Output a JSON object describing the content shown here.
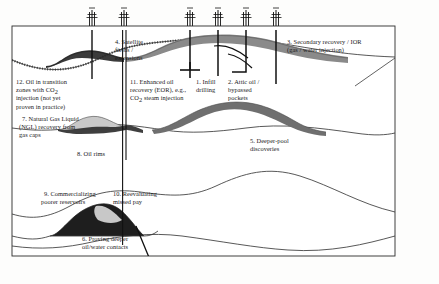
{
  "diagram": {
    "type": "geological-cross-section",
    "colors": {
      "background": "#fdfdfc",
      "frame_line": "#2b2b2b",
      "strata_line": "#3a3a3a",
      "reservoir_gray": "#8a8a8a",
      "reservoir_gray_dark": "#6f6f6f",
      "oil_dark": "#1e1e1e",
      "gas_cap_light": "#c8c8c8",
      "well_line": "#111111",
      "text": "#1a1a1a"
    },
    "frame": {
      "outer": true,
      "inner_surface_box": true
    }
  },
  "labels": [
    {
      "id": "1",
      "name": "infill-drilling",
      "lines": [
        "1. Infill",
        "drilling"
      ],
      "x": 196,
      "y": 84
    },
    {
      "id": "2",
      "name": "attic-oil-bypassed-pockets",
      "lines": [
        "2. Attic oil /",
        "bypassed",
        "pockets"
      ],
      "x": 228,
      "y": 84
    },
    {
      "id": "3",
      "name": "secondary-recovery-ior",
      "lines": [
        "3. Secondary recovery / IOR",
        "(gas / water injection)"
      ],
      "x": 287,
      "y": 44
    },
    {
      "id": "4",
      "name": "satellite-fields-extensions",
      "lines": [
        "4. Satellite",
        "fields /",
        "extensions"
      ],
      "x": 115,
      "y": 44
    },
    {
      "id": "5",
      "name": "deeper-pool-discoveries",
      "lines": [
        "5. Deeper-pool",
        "discoveries",
        ""
      ],
      "x": 250,
      "y": 143
    },
    {
      "id": "6",
      "name": "proving-deeper-oil-water-contacts",
      "lines": [
        "6. Proving deeper",
        "oil/water contacts"
      ],
      "x": 82,
      "y": 241
    },
    {
      "id": "7",
      "name": "ngl-recovery-from-gas-caps",
      "lines": [
        "7. Natural Gas Liquid",
        "(NGL) recovery from",
        "gas caps"
      ],
      "x": 22,
      "y": 121
    },
    {
      "id": "8",
      "name": "oil-rims",
      "lines": [
        "8. Oil rims"
      ],
      "x": 77,
      "y": 156
    },
    {
      "id": "9",
      "name": "commercializing-poorer-reservoirs",
      "lines": [
        "9. Commercializing",
        "poorer reservoirs"
      ],
      "x": 44,
      "y": 196
    },
    {
      "id": "10",
      "name": "reevaluating-missed-pay",
      "lines": [
        "10. Reevaluating",
        "missed pay"
      ],
      "x": 113,
      "y": 196
    },
    {
      "id": "11",
      "name": "enhanced-oil-recovery-eor",
      "lines": [
        "11. Enhanced oil",
        "recovery (EOR), e.g.,",
        "CO2 steam injection"
      ],
      "x": 130,
      "y": 84
    },
    {
      "id": "12",
      "name": "oil-in-transition-zones-co2",
      "lines": [
        "12. Oil in transition",
        "zones with CO2",
        "injection (not yet",
        "proven in practice)"
      ],
      "x": 16,
      "y": 84
    }
  ],
  "derricks": [
    {
      "name": "derrick-1",
      "x": 92
    },
    {
      "name": "derrick-2",
      "x": 124
    },
    {
      "name": "derrick-3",
      "x": 190
    },
    {
      "name": "derrick-4",
      "x": 218
    },
    {
      "name": "derrick-5",
      "x": 246
    },
    {
      "name": "derrick-6",
      "x": 276
    }
  ],
  "wellbores": [
    {
      "name": "wellbore-satellite-left",
      "x": 92,
      "bottom": 79
    },
    {
      "name": "wellbore-deep-vertical",
      "x": 124,
      "bottom": 245
    },
    {
      "name": "wellbore-eor-injector",
      "x": 190,
      "bottom": 70
    },
    {
      "name": "wellbore-infill",
      "x": 218,
      "bottom": 76
    },
    {
      "name": "wellbore-attic-deviated",
      "x": 246,
      "bottom": 72
    },
    {
      "name": "wellbore-secondary-deep",
      "x": 276,
      "bottom": 84
    }
  ],
  "markers": [
    {
      "name": "injection-cross-marker",
      "x": 190,
      "y": 70
    }
  ],
  "reservoirs": [
    {
      "name": "reservoir-satellite-left",
      "fill": "oil_dark"
    },
    {
      "name": "reservoir-main-dome",
      "fill": "reservoir_gray"
    },
    {
      "name": "reservoir-gas-cap-mid",
      "fill": "gas_cap_light"
    },
    {
      "name": "reservoir-oil-rim-mid",
      "fill": "oil_dark"
    },
    {
      "name": "reservoir-deeper-pool",
      "fill": "reservoir_gray_dark"
    },
    {
      "name": "reservoir-lower-oil",
      "fill": "oil_dark"
    },
    {
      "name": "reservoir-lower-gas-cap",
      "fill": "gas_cap_light"
    }
  ]
}
